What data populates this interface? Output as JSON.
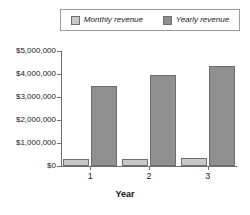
{
  "chart_data": {
    "type": "bar",
    "title": "",
    "subtitle": "",
    "xlabel": "Year",
    "ylabel": "",
    "categories": [
      "1",
      "2",
      "3"
    ],
    "series": [
      {
        "name": "Monthly revenue",
        "color": "#c8c8c8",
        "values": [
          290000,
          310000,
          360000
        ]
      },
      {
        "name": "Yearly revenue",
        "color": "#8f8f8f",
        "values": [
          3500000,
          3950000,
          4350000
        ]
      }
    ],
    "ylim": [
      0,
      5000000
    ],
    "yticks": [
      0,
      1000000,
      2000000,
      3000000,
      4000000,
      5000000
    ],
    "ytick_labels": [
      "$0",
      "$1,000,000",
      "$2,000,000",
      "$3,000,000",
      "$4,000,000",
      "$5,000,000"
    ],
    "grid": false,
    "legend_position": "top"
  },
  "legend": {
    "entries": [
      {
        "label": "Monthly revenue",
        "swatch": "#c8c8c8"
      },
      {
        "label": "Yearly revenue",
        "swatch": "#8f8f8f"
      }
    ]
  },
  "axes": {
    "x_title": "Year"
  }
}
